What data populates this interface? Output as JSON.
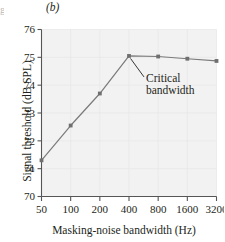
{
  "panel": {
    "label": "(b)",
    "edge_remnant": "g"
  },
  "axes": {
    "y_title": "Signal threshold (dB SPL)",
    "x_title": "Masking-noise bandwidth (Hz)"
  },
  "annotation": {
    "line1": "Critical",
    "line2": "bandwidth"
  },
  "colors": {
    "line": "#7a7a7a",
    "marker": "#6f6f6f",
    "axis": "#555555",
    "plot_background": "#f2f2f2",
    "grid": "#e6e6e6",
    "text": "#231f20"
  },
  "chart_data": {
    "type": "line",
    "title": "",
    "xlabel": "Masking-noise bandwidth (Hz)",
    "ylabel": "Signal threshold (dB SPL)",
    "x_scale": "log2-equal-spacing",
    "categories": [
      "50",
      "100",
      "200",
      "400",
      "800",
      "1600",
      "3200"
    ],
    "x": [
      50,
      100,
      200,
      400,
      800,
      1600,
      3200
    ],
    "values": [
      71.3,
      72.55,
      73.7,
      75.05,
      75.03,
      74.95,
      74.87
    ],
    "xtick_labels": [
      "50",
      "100",
      "200",
      "400",
      "800",
      "1600",
      "3200"
    ],
    "ytick_labels": [
      "70",
      "71",
      "72",
      "73",
      "74",
      "75",
      "76"
    ],
    "yticks": [
      70,
      71,
      72,
      73,
      74,
      75,
      76
    ],
    "ylim": [
      70,
      76
    ],
    "grid": true,
    "legend": false,
    "annotations": [
      {
        "text": "Critical bandwidth",
        "points_to_x": 400,
        "points_to_y": 75.05
      }
    ]
  }
}
